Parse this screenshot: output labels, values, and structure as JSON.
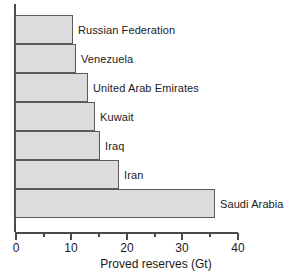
{
  "chart_data": {
    "type": "bar",
    "orientation": "horizontal",
    "title": "",
    "xlabel": "Proved reserves (Gt)",
    "ylabel": "",
    "categories": [
      "Russian Federation",
      "Venezuela",
      "United Arab Emirates",
      "Kuwait",
      "Iraq",
      "Iran",
      "Saudi Arabia"
    ],
    "values": [
      10.5,
      11.0,
      13.1,
      14.5,
      15.4,
      18.7,
      36.0
    ],
    "xlim": [
      0,
      40
    ],
    "xticks": [
      0,
      10,
      20,
      30,
      40
    ],
    "xtick_labels": [
      "0",
      "10",
      "20",
      "30",
      "40"
    ],
    "xticks_minor": [
      5,
      15,
      25,
      35
    ],
    "grid": false,
    "legend": false,
    "bar_fill_color": "#dcdcdc",
    "bar_edge_color": "#5a5a5a",
    "axis_color": "#4a4a4a"
  }
}
